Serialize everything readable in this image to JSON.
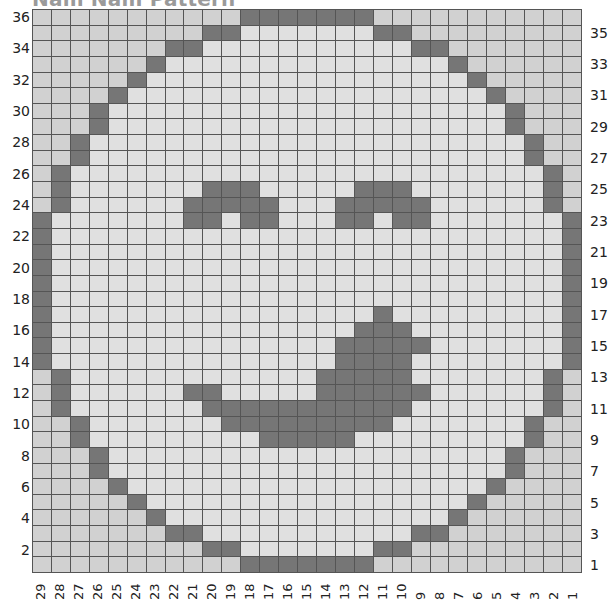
{
  "title": "Nam Nam Pattern",
  "grid": {
    "columns": 29,
    "rows": 36,
    "legend": {
      "#": "dark stitch",
      ".": "light stitch (inside face)",
      "o": "light stitch (outside face)"
    },
    "colors": {
      "dark": "#767676",
      "light_inside": "#e0e0e0",
      "light_outside": "#d1d1d1",
      "gridline": "#555555"
    },
    "pattern": [
      "ooooooooooo#######ooooooooooo",
      "ooooooooo##.......##ooooooooo",
      "ooooooo##...........##ooooooo",
      "oooooo#...............#oooooo",
      "ooooo#.................#ooooo",
      "oooo#...................#oooo",
      "ooo#.....................#ooo",
      "ooo#.....................#ooo",
      "oo#.......................#oo",
      "oo#.......................#oo",
      "o#.........................#o",
      "o#.......###.....###.......#o",
      "o#......#####...#####......#o",
      "#.......##.##...##.##.......#",
      "#...........................#",
      "#...........................#",
      "#...........................#",
      "#...........................#",
      "#...........................#",
      "#.................#.........#",
      "#................###........#",
      "#...............#####.......#",
      "#...............####........#",
      "o#.............#####.......#o",
      "o#......##.....######......#o",
      "o#.......###########.......#o",
      "oo#.......#########.......#oo",
      "oo#.........#####.........#oo",
      "ooo#.....................#ooo",
      "ooo#.....................#ooo",
      "oooo#...................#oooo",
      "ooooo#.................#ooooo",
      "oooooo#...............#oooooo",
      "ooooooo##...........##ooooooo",
      "ooooooooo##.......##ooooooooo",
      "ooooooooooo#######ooooooooooo"
    ]
  },
  "row_labels": {
    "left": [
      "36",
      "34",
      "32",
      "30",
      "28",
      "26",
      "24",
      "22",
      "20",
      "18",
      "16",
      "14",
      "12",
      "10",
      "8",
      "6",
      "4",
      "2"
    ],
    "right": [
      "35",
      "33",
      "31",
      "29",
      "27",
      "25",
      "23",
      "21",
      "19",
      "17",
      "15",
      "13",
      "11",
      "9",
      "7",
      "5",
      "3",
      "1"
    ]
  },
  "column_labels": [
    "29",
    "28",
    "27",
    "26",
    "25",
    "24",
    "23",
    "22",
    "21",
    "20",
    "19",
    "18",
    "17",
    "16",
    "15",
    "14",
    "13",
    "12",
    "11",
    "10",
    "9",
    "8",
    "7",
    "6",
    "5",
    "4",
    "3",
    "2",
    "1"
  ]
}
